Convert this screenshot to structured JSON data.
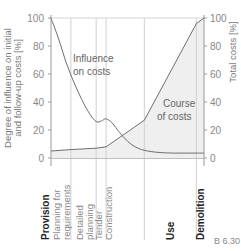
{
  "chart_data": {
    "type": "line",
    "title": "",
    "figure_label": "B 6.30",
    "ylabel_left": "Degree of influence on initial and follow-up costs [%]",
    "ylabel_left_lines": [
      "Degree of influence on initial",
      "and follow-up costs [%]"
    ],
    "ylabel_right": "Total costs [%]",
    "ylim": [
      0,
      100
    ],
    "yticks_left": [
      0,
      20,
      40,
      60,
      80,
      100
    ],
    "yticks_right": [
      0,
      20,
      40,
      60,
      80,
      100
    ],
    "grid": {
      "horizontal_top": true,
      "phase_dividers": true
    },
    "phases": [
      {
        "label": "Provision",
        "bold": true
      },
      {
        "label": "Planning for requirements",
        "lines": [
          "Planning for",
          "requirements"
        ]
      },
      {
        "label": "Detailed planning",
        "lines": [
          "Detailed",
          "planning"
        ]
      },
      {
        "label": "Tender",
        "lines": [
          "Tender"
        ]
      },
      {
        "label": "Construction",
        "lines": [
          "Construction"
        ]
      },
      {
        "label": "Use",
        "bold": true
      },
      {
        "label": "Demolition",
        "bold": true
      }
    ],
    "phase_boundaries_x": [
      0,
      13,
      29.5,
      36,
      61,
      95,
      100
    ],
    "series": [
      {
        "name": "Influence on costs",
        "annotation": [
          "Influence",
          "on costs"
        ],
        "x": [
          0,
          5,
          10,
          15,
          20,
          25,
          29.5,
          33,
          36,
          40,
          45,
          50,
          55,
          61,
          70,
          80,
          90,
          100
        ],
        "values": [
          100,
          85,
          68,
          54,
          42,
          32,
          26,
          26.5,
          28,
          25,
          18,
          12,
          8,
          5.5,
          4,
          3.5,
          3.5,
          3.5
        ]
      },
      {
        "name": "Course of costs",
        "annotation": [
          "Course",
          "of costs"
        ],
        "filled": true,
        "x": [
          0,
          13,
          29.5,
          36,
          61,
          95,
          100
        ],
        "values": [
          5,
          6,
          7,
          8,
          27,
          96,
          100
        ]
      }
    ],
    "colors": {
      "line": "#6e6e6e",
      "fill": "#efefef",
      "grid": "#cfcfcf",
      "axis": "#9a9a9a"
    }
  }
}
